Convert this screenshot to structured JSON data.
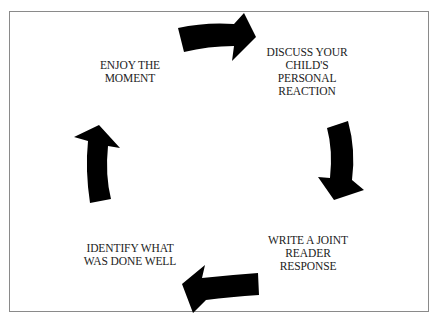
{
  "diagram": {
    "type": "cycle",
    "steps": [
      {
        "id": "enjoy",
        "lines": [
          "ENJOY THE",
          "MOMENT"
        ]
      },
      {
        "id": "discuss",
        "lines": [
          "DISCUSS YOUR",
          "CHILD'S",
          "PERSONAL",
          "REACTION"
        ]
      },
      {
        "id": "write",
        "lines": [
          "WRITE A JOINT",
          "READER",
          "RESPONSE"
        ]
      },
      {
        "id": "identify",
        "lines": [
          "IDENTIFY WHAT",
          "WAS DONE WELL"
        ]
      }
    ],
    "arrows": [
      {
        "id": "enjoy-to-discuss",
        "direction": "right"
      },
      {
        "id": "discuss-to-write",
        "direction": "down"
      },
      {
        "id": "write-to-identify",
        "direction": "left"
      },
      {
        "id": "identify-to-enjoy",
        "direction": "up"
      }
    ],
    "colors": {
      "arrow": "#000000",
      "text": "#222222",
      "border": "#8a8a8a",
      "background": "#ffffff"
    }
  }
}
